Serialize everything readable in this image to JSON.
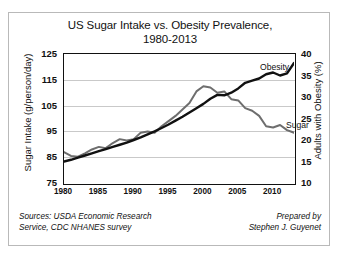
{
  "chart_data": {
    "type": "line",
    "title": "US Sugar Intake vs. Obesity Prevalence, 1980-2013",
    "title_line1": "US Sugar Intake vs. Obesity Prevalence,",
    "title_line2": "1980-2013",
    "xlabel": "",
    "ylabel": "Sugar Intake (g/person/day)",
    "ylabel_right": "Adults with Obesity (%)",
    "ylim": [
      75,
      125
    ],
    "ylim_right": [
      10,
      40
    ],
    "xlim": [
      1980,
      2013
    ],
    "yticks": [
      75,
      85,
      95,
      105,
      115,
      125
    ],
    "yticks_right": [
      10,
      15,
      20,
      25,
      30,
      35,
      40
    ],
    "xticks": [
      1980,
      1985,
      1990,
      1995,
      2000,
      2005,
      2010
    ],
    "grid": true,
    "legend_position": "inline-annotation",
    "x": [
      1980,
      1981,
      1982,
      1983,
      1984,
      1985,
      1986,
      1987,
      1988,
      1989,
      1990,
      1991,
      1992,
      1993,
      1994,
      1995,
      1996,
      1997,
      1998,
      1999,
      2000,
      2001,
      2002,
      2003,
      2004,
      2005,
      2006,
      2007,
      2008,
      2009,
      2010,
      2011,
      2012,
      2013
    ],
    "series": [
      {
        "name": "Sugar",
        "axis": "left",
        "units": "g/person/day",
        "color": "#6e6e6e",
        "values": [
          87.0,
          85.5,
          85.2,
          86.5,
          88.0,
          89.0,
          88.5,
          90.5,
          92.0,
          91.5,
          92.0,
          94.5,
          95.0,
          94.5,
          97.0,
          99.0,
          101.0,
          103.5,
          106.0,
          110.5,
          112.5,
          112.0,
          110.0,
          110.5,
          107.5,
          107.0,
          104.0,
          103.0,
          101.0,
          97.0,
          96.5,
          97.5,
          95.5,
          94.5
        ]
      },
      {
        "name": "Obesity",
        "axis": "right",
        "units": "% of adults",
        "color": "#111111",
        "values": [
          15.0,
          15.4,
          15.9,
          16.4,
          16.9,
          17.4,
          17.9,
          18.4,
          18.9,
          19.4,
          20.0,
          20.6,
          21.3,
          22.0,
          22.8,
          23.6,
          24.5,
          25.4,
          26.4,
          27.4,
          28.4,
          29.6,
          30.5,
          30.4,
          31.0,
          32.0,
          33.3,
          33.8,
          34.3,
          35.3,
          35.7,
          35.0,
          35.5,
          37.9
        ]
      }
    ],
    "annotations": [
      {
        "text": "Obesity",
        "series": "Obesity"
      },
      {
        "text": "Sugar",
        "series": "Sugar"
      }
    ]
  },
  "footer": {
    "sources_line1": "Sources: USDA Economic Research",
    "sources_line2": "Service, CDC NHANES survey",
    "prepared_line1": "Prepared by",
    "prepared_line2": "Stephen J. Guyenet"
  }
}
